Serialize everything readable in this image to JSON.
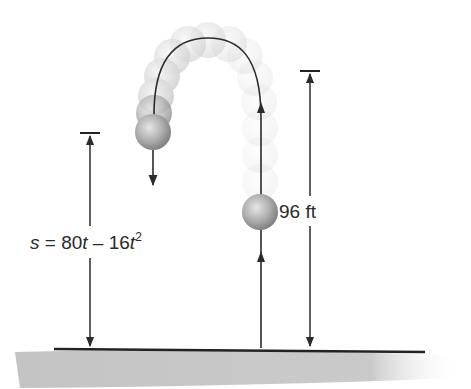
{
  "diagram": {
    "type": "projectile-motion",
    "equation": {
      "var": "s",
      "eq": " = 80",
      "t1": "t",
      "minus": " – 16",
      "t2": "t",
      "exp": "2"
    },
    "height_label": "96 ft",
    "colors": {
      "line": "#2b2b2b",
      "ball": "#a8a8a8",
      "ground": "#bcbcbc"
    },
    "elements": {
      "trajectory": "arc from ground up to apex then down",
      "balls_solid": 2,
      "ghost_balls": "fading trail along path"
    }
  }
}
